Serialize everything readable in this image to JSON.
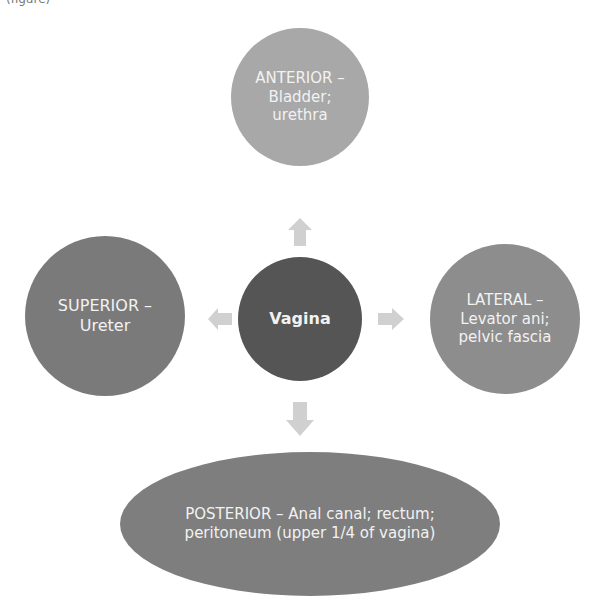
{
  "caption": "(figure)",
  "center": {
    "label": "Vagina",
    "color": "#555555"
  },
  "anterior": {
    "label": "ANTERIOR –\nBladder;\nurethra",
    "color": "#a8a8a8"
  },
  "superior": {
    "label": "SUPERIOR –\nUreter",
    "color": "#7a7a7a"
  },
  "lateral": {
    "label": "LATERAL –\nLevator ani;\npelvic fascia",
    "color": "#8d8d8d"
  },
  "posterior": {
    "label": "POSTERIOR – Anal canal; rectum;\nperitoneum (upper 1/4 of vagina)",
    "color": "#7e7e7e"
  },
  "arrow_color": "#d0d0d0"
}
